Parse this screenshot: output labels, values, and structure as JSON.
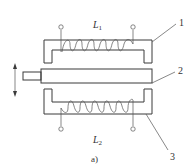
{
  "figure": {
    "caption": "a)",
    "components": [
      {
        "id": "1",
        "label": "1",
        "name": "upper-core",
        "coil_label": "L",
        "coil_subscript": "1"
      },
      {
        "id": "2",
        "label": "2",
        "name": "moving-armature"
      },
      {
        "id": "3",
        "label": "3",
        "name": "lower-core",
        "coil_label": "L",
        "coil_subscript": "2"
      }
    ],
    "motion_arrow": "vertical double-headed arrow",
    "colors": {
      "line": "#3a3a3a",
      "background": "#ffffff"
    }
  }
}
